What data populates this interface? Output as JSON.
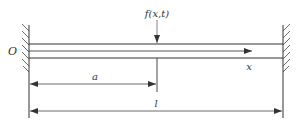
{
  "diagram": {
    "type": "fixed-fixed beam with point load",
    "labels": {
      "origin": "O",
      "force": "f(x,t)",
      "axis": "x",
      "load_position": "a",
      "length": "l"
    },
    "colors": {
      "line": "#333333",
      "background": "#ffffff"
    }
  }
}
